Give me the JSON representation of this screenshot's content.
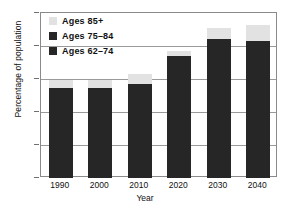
{
  "chart_data": {
    "type": "bar",
    "title": "",
    "subtitle": "",
    "xlabel": "Year",
    "ylabel": "Percentage of population",
    "categories": [
      "1990",
      "2000",
      "2010",
      "2020",
      "2030",
      "2040"
    ],
    "ylim": [
      0,
      25
    ],
    "yticks": [
      "0",
      "5",
      "10",
      "15",
      "20",
      "25"
    ],
    "grid": true,
    "stacked": true,
    "legend_position": "top-left",
    "series": [
      {
        "name": "Ages 62–74",
        "color": "#262626",
        "values": [
          9.2,
          8.6,
          9.6,
          13.2,
          14.0,
          13.1
        ]
      },
      {
        "name": "Ages 75–84",
        "color": "#262626",
        "values": [
          4.5,
          5.0,
          4.7,
          5.3,
          7.0,
          7.7
        ]
      },
      {
        "name": "Ages 85+",
        "color": "#e2e2e2",
        "values": [
          1.2,
          1.2,
          1.5,
          0.7,
          1.8,
          2.4
        ]
      }
    ],
    "stack_totals": [
      14.9,
      14.8,
      15.8,
      19.2,
      22.8,
      23.2
    ],
    "dark_tops": [
      13.7,
      13.6,
      14.3,
      18.5,
      21.0,
      20.8
    ]
  },
  "legend": {
    "items": [
      {
        "label": "Ages 85+",
        "color": "#e2e2e2"
      },
      {
        "label": "Ages 75–84",
        "color": "#262626"
      },
      {
        "label": "Ages 62–74",
        "color": "#262626"
      }
    ]
  },
  "axes": {
    "x_title": "Year",
    "y_title": "Percentage of population",
    "y_ticks": [
      "25",
      "20",
      "15",
      "10",
      "5",
      "0"
    ],
    "x_ticks": [
      "1990",
      "2000",
      "2010",
      "2020",
      "2030",
      "2040"
    ]
  }
}
